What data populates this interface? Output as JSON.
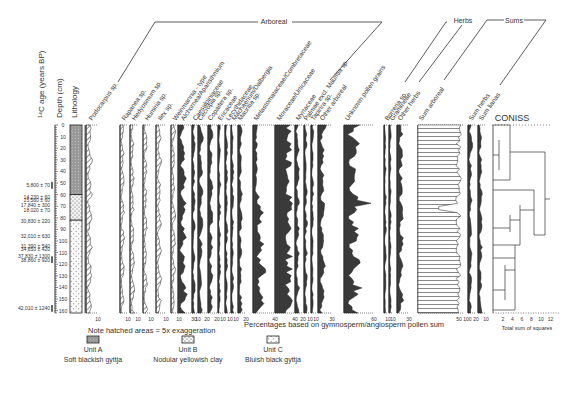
{
  "chart_data": {
    "type": "pollen-diagram",
    "title": "",
    "ylabel_age": "14C age (years BP)",
    "ylabel_depth": "Depth (cm)",
    "lithology_label": "Lithology",
    "depth_ticks": [
      0,
      10,
      20,
      30,
      40,
      50,
      60,
      70,
      80,
      90,
      100,
      110,
      120,
      130,
      140,
      150,
      160
    ],
    "depth_range": [
      0,
      162
    ],
    "ages": [
      {
        "label": "5,800 ± 70",
        "depth": 52
      },
      {
        "label": "14,230 ± 60",
        "depth": 62
      },
      {
        "label": "15,560 ± 60",
        "depth": 65
      },
      {
        "label": "17,840 ± 300",
        "depth": 69
      },
      {
        "label": "18,020 ± 70",
        "depth": 73
      },
      {
        "label": "30,830 ± 220",
        "depth": 83
      },
      {
        "label": "32,010 ± 630",
        "depth": 96
      },
      {
        "label": "31,390 ± 540",
        "depth": 104
      },
      {
        "label": "34,650 ± 420",
        "depth": 107
      },
      {
        "label": "37,830 ± 1300",
        "depth": 113
      },
      {
        "label": "38,860 ± 920",
        "depth": 116
      },
      {
        "label": "42,010 ± 1240",
        "depth": 158
      }
    ],
    "groups": [
      {
        "name": "Arboreal"
      },
      {
        "name": "Herbs"
      },
      {
        "name": "Sums"
      }
    ],
    "taxa": [
      {
        "name": "Podocarpus sp.",
        "group": "Arboreal",
        "scale_max": 10,
        "hatched": true
      },
      {
        "name": "Rapanea sp.",
        "group": "Arboreal",
        "scale_max": 10,
        "hatched": true
      },
      {
        "name": "Hedyosmum sp.",
        "group": "Arboreal",
        "scale_max": 10,
        "hatched": true
      },
      {
        "name": "Humiria sp.",
        "group": "Arboreal",
        "scale_max": 10,
        "hatched": true
      },
      {
        "name": "Ilex sp.",
        "group": "Arboreal",
        "scale_max": 10,
        "hatched": true
      },
      {
        "name": "Weinmannia - type",
        "group": "Arboreal",
        "scale_max": 10,
        "hatched": true
      },
      {
        "name": "Alchornea/Aparisthmium",
        "group": "Arboreal",
        "scale_max": 30
      },
      {
        "name": "Caesalpiniaceae",
        "group": "Arboreal",
        "scale_max": 10
      },
      {
        "name": "Cecropia sp.",
        "group": "Arboreal",
        "scale_max": 20
      },
      {
        "name": "Copaifera sp.",
        "group": "Arboreal",
        "scale_max": 20
      },
      {
        "name": "Ericaceae",
        "group": "Arboreal",
        "scale_max": 10
      },
      {
        "name": "Lecythidaceae",
        "group": "Arboreal",
        "scale_max": 10
      },
      {
        "name": "Machaerium/Dalbergia",
        "group": "Arboreal",
        "scale_max": 10
      },
      {
        "name": "Mauritia sp.",
        "group": "Arboreal",
        "scale_max": 20
      },
      {
        "name": "Melastomataceae/Combretaceae",
        "group": "Arboreal",
        "scale_max": 40
      },
      {
        "name": "Moraceae/Urticaceae",
        "group": "Arboreal",
        "scale_max": 40
      },
      {
        "name": "Myrtaceae",
        "group": "Arboreal",
        "scale_max": 20
      },
      {
        "name": "Palmae excl. Mauritia sp.",
        "group": "Arboreal",
        "scale_max": 10
      },
      {
        "name": "Tapirira sp.",
        "group": "Arboreal",
        "scale_max": 10
      },
      {
        "name": "Other arboreal",
        "group": "Arboreal",
        "scale_max": 30
      },
      {
        "name": "Unknown pollen grains",
        "group": "Other",
        "scale_max": 60
      },
      {
        "name": "Borreria sp.",
        "group": "Herbs",
        "scale_max": 10
      },
      {
        "name": "Gramineae",
        "group": "Herbs",
        "scale_max": 10
      },
      {
        "name": "Other herbs",
        "group": "Herbs",
        "scale_max": 30
      },
      {
        "name": "Sum arboreal",
        "group": "Sums",
        "scale_ticks": [
          50,
          100
        ]
      },
      {
        "name": "Sum herbs",
        "group": "Sums",
        "scale_max": 20
      },
      {
        "name": "Sum lianas",
        "group": "Sums",
        "scale_max": 10
      }
    ],
    "coniss": {
      "title": "CONISS",
      "xlabel": "Total sum of squares",
      "ticks": [
        2,
        4,
        6,
        8,
        10,
        12
      ],
      "top_split_depth": 62
    },
    "xlabel": "Percentages based on gymnosperm/angiosperm pollen sum",
    "note": "Note hatched areas = 5x exaggeration",
    "legend": [
      {
        "unit": "Unit A",
        "description": "Soft blackish gyttja"
      },
      {
        "unit": "Unit B",
        "description": "Nodular yellowish clay"
      },
      {
        "unit": "Unit C",
        "description": "Bluish black gyttja"
      }
    ],
    "lithology": [
      {
        "unit": "Unit A",
        "from": 0,
        "to": 60
      },
      {
        "unit": "Unit B",
        "from": 60,
        "to": 82
      },
      {
        "unit": "Unit C",
        "from": 82,
        "to": 162
      }
    ]
  },
  "labels": {
    "age": "¹⁴C age (years BP)",
    "depth": "Depth (cm)",
    "lithology": "Lithology",
    "arboreal": "Arboreal",
    "herbs": "Herbs",
    "sums": "Sums",
    "coniss": "CONISS",
    "coniss_x": "Total sum of squares",
    "note": "Note hatched areas = 5x exaggeration",
    "xlabel": "Percentages based on gymnosperm/angiosperm pollen sum",
    "unitA": "Unit A",
    "unitA_desc": "Soft blackish gyttja",
    "unitB": "Unit B",
    "unitB_desc": "Nodular yellowish clay",
    "unitC": "Unit C",
    "unitC_desc": "Bluish black gyttja"
  }
}
